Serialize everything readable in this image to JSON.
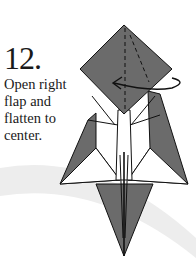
{
  "step": {
    "number": "12.",
    "instruction": "Open right flap and flatten to center."
  },
  "colors": {
    "paper_fill": "#6b6b6b",
    "outline": "#111111",
    "background": "#ffffff",
    "swoosh": "#eeeeee"
  },
  "diagram": {
    "arrow": "curved-arrow-left",
    "fold_lines": "dashed-valley-fold"
  }
}
